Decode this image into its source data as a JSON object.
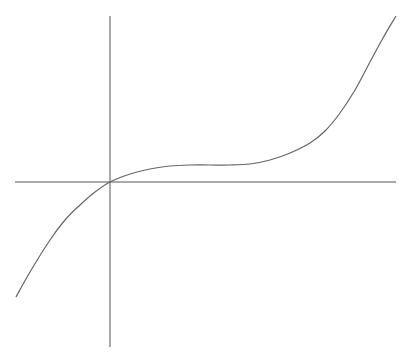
{
  "chart_data": {
    "type": "line",
    "title": "",
    "xlabel": "",
    "ylabel": "",
    "grid": false,
    "legend": null,
    "axes": {
      "x_axis_pixel": {
        "y": 182,
        "x_start": 15,
        "x_end": 396
      },
      "y_axis_pixel": {
        "x": 110,
        "y_start": 16,
        "y_end": 347
      }
    },
    "series": [
      {
        "name": "curve",
        "color": "#666666",
        "points_px": [
          [
            16,
            297
          ],
          [
            30,
            272
          ],
          [
            50,
            240
          ],
          [
            65,
            220
          ],
          [
            80,
            205
          ],
          [
            95,
            192
          ],
          [
            110,
            182
          ],
          [
            130,
            174
          ],
          [
            150,
            169
          ],
          [
            170,
            166
          ],
          [
            190,
            165
          ],
          [
            210,
            165
          ],
          [
            230,
            165
          ],
          [
            250,
            164
          ],
          [
            270,
            160
          ],
          [
            290,
            153
          ],
          [
            310,
            143
          ],
          [
            325,
            131
          ],
          [
            340,
            113
          ],
          [
            355,
            90
          ],
          [
            370,
            62
          ],
          [
            383,
            38
          ],
          [
            396,
            16
          ]
        ]
      }
    ],
    "axis_color": "#555555"
  }
}
